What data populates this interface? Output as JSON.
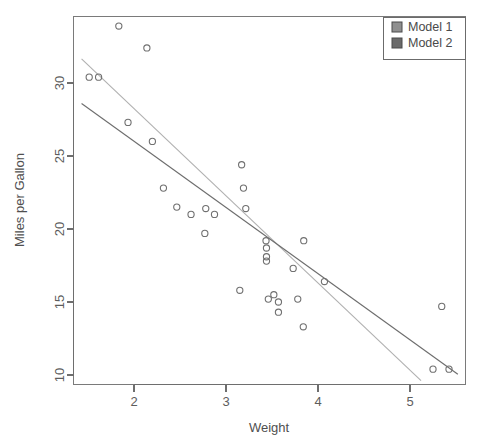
{
  "chart_data": {
    "type": "scatter",
    "title": "",
    "xlabel": "Weight",
    "ylabel": "Miles per Gallon",
    "xlim": [
      1.43,
      5.52
    ],
    "ylim": [
      9.6,
      34.6
    ],
    "xticks": [
      2,
      3,
      4,
      5
    ],
    "yticks": [
      10,
      15,
      20,
      25,
      30
    ],
    "xtick_labels": [
      "2",
      "3",
      "4",
      "5"
    ],
    "ytick_labels": [
      "10",
      "15",
      "20",
      "25",
      "30"
    ],
    "grid": false,
    "legend_position": "top-right",
    "points": [
      {
        "x": 1.513,
        "y": 30.4
      },
      {
        "x": 1.615,
        "y": 30.4
      },
      {
        "x": 1.835,
        "y": 33.9
      },
      {
        "x": 1.935,
        "y": 27.3
      },
      {
        "x": 2.14,
        "y": 32.4
      },
      {
        "x": 2.2,
        "y": 26.0
      },
      {
        "x": 2.32,
        "y": 22.8
      },
      {
        "x": 2.465,
        "y": 21.5
      },
      {
        "x": 2.62,
        "y": 21.0
      },
      {
        "x": 2.77,
        "y": 19.7
      },
      {
        "x": 2.78,
        "y": 21.4
      },
      {
        "x": 2.875,
        "y": 21.0
      },
      {
        "x": 3.15,
        "y": 15.8
      },
      {
        "x": 3.17,
        "y": 24.4
      },
      {
        "x": 3.19,
        "y": 22.8
      },
      {
        "x": 3.215,
        "y": 21.4
      },
      {
        "x": 3.435,
        "y": 19.2
      },
      {
        "x": 3.44,
        "y": 18.7
      },
      {
        "x": 3.44,
        "y": 17.8
      },
      {
        "x": 3.44,
        "y": 18.1
      },
      {
        "x": 3.46,
        "y": 15.2
      },
      {
        "x": 3.52,
        "y": 15.5
      },
      {
        "x": 3.57,
        "y": 14.3
      },
      {
        "x": 3.57,
        "y": 15.0
      },
      {
        "x": 3.73,
        "y": 17.3
      },
      {
        "x": 3.78,
        "y": 15.2
      },
      {
        "x": 3.84,
        "y": 13.3
      },
      {
        "x": 3.845,
        "y": 19.2
      },
      {
        "x": 4.07,
        "y": 16.4
      },
      {
        "x": 5.25,
        "y": 10.4
      },
      {
        "x": 5.345,
        "y": 14.7
      },
      {
        "x": 5.424,
        "y": 10.4
      }
    ],
    "series": [
      {
        "name": "Model 1",
        "type": "line",
        "color": "#b0b0b0",
        "x": [
          1.43,
          5.12
        ],
        "y": [
          31.65,
          9.62
        ]
      },
      {
        "name": "Model 2",
        "type": "line",
        "color": "#6d6d6d",
        "x": [
          1.43,
          5.52
        ],
        "y": [
          28.6,
          10.05
        ]
      }
    ],
    "marker": {
      "shape": "circle-open",
      "radius": 3.1,
      "color": "#707070"
    }
  },
  "legend": {
    "entries": [
      {
        "label": "Model 1",
        "swatch_color": "#8f8f8f"
      },
      {
        "label": "Model 2",
        "swatch_color": "#6a6a6a"
      }
    ]
  },
  "axes": {
    "x_title": "Weight",
    "y_title": "Miles per Gallon"
  },
  "colors": {
    "background": "#ffffff",
    "frame": "#7a7a7a",
    "text": "#4f4f4f",
    "model1_line": "#b0b0b0",
    "model2_line": "#6d6d6d",
    "point_stroke": "#707070"
  }
}
